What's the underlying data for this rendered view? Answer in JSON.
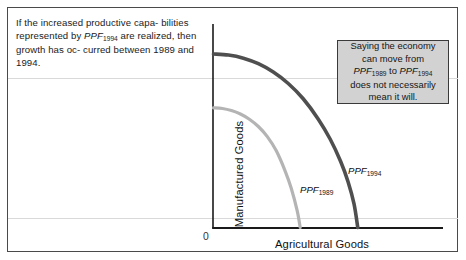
{
  "caption": {
    "line1": "If the increased productive capa-",
    "line2_a": "bilities represented by ",
    "line2_ppf": "PPF",
    "line2_sub": "1994",
    "line2_b": " are",
    "line3": "realized, then growth has oc-",
    "line4": "curred between 1989 and 1994."
  },
  "callout": {
    "line1": "Saying the economy",
    "line2": "can move from",
    "line3_ppf1": "PPF",
    "line3_sub1": "1989",
    "line3_mid": " to ",
    "line3_ppf2": "PPF",
    "line3_sub2": "1994",
    "line4": "does not necessarily",
    "line5": "mean it will.",
    "bg_color": "#d2d2d2",
    "border_color": "#3a3a3a"
  },
  "chart_data": {
    "type": "line",
    "title": "",
    "xlabel": "Agricultural Goods",
    "ylabel": "Manufactured Goods",
    "origin_label": "0",
    "grid": false,
    "legend_position": "inline-curve-labels",
    "axis_color": "#1a1a1a",
    "xlim": [
      0,
      100
    ],
    "ylim": [
      0,
      100
    ],
    "series": [
      {
        "name": "PPF1989",
        "label_base": "PPF",
        "label_sub": "1989",
        "color": "#b4b4b4",
        "width": 3.2,
        "x": [
          0,
          6,
          12,
          18,
          24,
          30,
          36,
          42,
          48,
          52,
          56,
          58
        ],
        "y": [
          69,
          68.6,
          67.4,
          65.4,
          62.4,
          58.2,
          52.4,
          44.2,
          32.4,
          22.6,
          9.6,
          0
        ],
        "x_intercept": 58,
        "y_intercept": 69
      },
      {
        "name": "PPF1994",
        "label_base": "PPF",
        "label_sub": "1994",
        "color": "#4f4f4f",
        "width": 3.6,
        "x": [
          0,
          10,
          20,
          30,
          40,
          50,
          60,
          70,
          78,
          85,
          90,
          94,
          96.5
        ],
        "y": [
          100,
          99.4,
          97.6,
          94.4,
          89.6,
          83.0,
          74.2,
          62.6,
          51.0,
          38.2,
          26.4,
          13.6,
          0
        ],
        "x_intercept": 96.5,
        "y_intercept": 100
      }
    ]
  }
}
